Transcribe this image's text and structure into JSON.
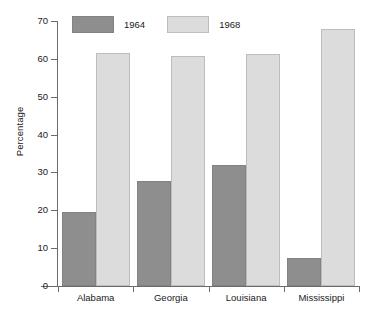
{
  "chart_data": {
    "type": "bar",
    "title": "",
    "subtitle": "",
    "xlabel": "",
    "ylabel": "Percentage",
    "categories": [
      "Alabama",
      "Georgia",
      "Louisiana",
      "Mississippi"
    ],
    "series": [
      {
        "name": "1964",
        "color": "#8e8e8e",
        "values": [
          19.5,
          27.8,
          32.0,
          7.3
        ]
      },
      {
        "name": "1968",
        "color": "#dcdcdc",
        "values": [
          61.5,
          60.8,
          61.3,
          68.0
        ]
      }
    ],
    "ylim": [
      0,
      70
    ],
    "ytick_values": [
      0,
      10,
      20,
      30,
      40,
      50,
      60,
      70
    ],
    "ytick_labels": [
      "0",
      "10",
      "20",
      "30",
      "40",
      "50",
      "60",
      "70"
    ],
    "grid": false,
    "legend_position": "top-left",
    "legend_entries": [
      "1964",
      "1968"
    ]
  },
  "axes": {
    "y_title": "Percentage"
  },
  "legend": {
    "items": [
      {
        "label": "1964"
      },
      {
        "label": "1968"
      }
    ]
  }
}
